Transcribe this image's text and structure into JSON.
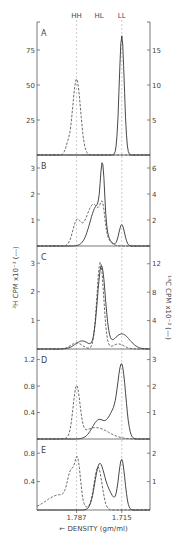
{
  "chart_data": {
    "type": "line",
    "title": "",
    "xlabel": "← DENSITY (gm/ml)",
    "ylabel_left": "³H CPM x10⁻³ (---)",
    "ylabel_right": "¹⁴C CPM x10⁻³ (—)",
    "x_ticks": [
      {
        "label": "1.787",
        "pos": 0.35
      },
      {
        "label": "1.715",
        "pos": 0.75
      }
    ],
    "reference_lines": [
      {
        "label": "HH",
        "pos": 0.35
      },
      {
        "label": "HL",
        "pos": 0.55
      },
      {
        "label": "LL",
        "pos": 0.75
      }
    ],
    "colors": {
      "axis": "#555555",
      "solid": "#333333",
      "dashed": "#444444",
      "ref": "#aaaaaa"
    },
    "panels": [
      {
        "label": "A",
        "left_ticks": [
          {
            "v": 25,
            "label": "25"
          },
          {
            "v": 50,
            "label": "50"
          },
          {
            "v": 75,
            "label": "75"
          }
        ],
        "left_max": 95,
        "right_ticks": [
          {
            "v": 5,
            "label": "5"
          },
          {
            "v": 10,
            "label": "10"
          },
          {
            "v": 15,
            "label": "15"
          }
        ],
        "right_max": 19,
        "dashed_peaks": [
          {
            "x": 0.35,
            "h": 0.58,
            "w": 0.035
          },
          {
            "x": 0.27,
            "h": 0.06,
            "w": 0.02
          }
        ],
        "solid_peaks": [
          {
            "x": 0.75,
            "h": 0.91,
            "w": 0.022
          }
        ]
      },
      {
        "label": "B",
        "left_ticks": [
          {
            "v": 1,
            "label": "1"
          },
          {
            "v": 2,
            "label": "2"
          },
          {
            "v": 3,
            "label": "3"
          }
        ],
        "left_max": 3.5,
        "right_ticks": [
          {
            "v": 2,
            "label": "2"
          },
          {
            "v": 4,
            "label": "4"
          },
          {
            "v": 6,
            "label": "6"
          }
        ],
        "right_max": 7,
        "dashed_peaks": [
          {
            "x": 0.35,
            "h": 0.25,
            "w": 0.035
          },
          {
            "x": 0.5,
            "h": 0.47,
            "w": 0.07
          },
          {
            "x": 0.58,
            "h": 0.25,
            "w": 0.02
          }
        ],
        "solid_peaks": [
          {
            "x": 0.58,
            "h": 0.62,
            "w": 0.018
          },
          {
            "x": 0.53,
            "h": 0.45,
            "w": 0.06
          },
          {
            "x": 0.75,
            "h": 0.24,
            "w": 0.025
          }
        ]
      },
      {
        "label": "C",
        "left_ticks": [
          {
            "v": 1,
            "label": "1"
          },
          {
            "v": 2,
            "label": "2"
          },
          {
            "v": 3,
            "label": "3"
          }
        ],
        "left_max": 3.6,
        "right_ticks": [
          {
            "v": 4,
            "label": "4"
          },
          {
            "v": 8,
            "label": "8"
          },
          {
            "v": 12,
            "label": "12"
          }
        ],
        "right_max": 14.5,
        "dashed_peaks": [
          {
            "x": 0.56,
            "h": 0.86,
            "w": 0.03
          },
          {
            "x": 0.35,
            "h": 0.06,
            "w": 0.05
          },
          {
            "x": 0.72,
            "h": 0.05,
            "w": 0.05
          }
        ],
        "solid_peaks": [
          {
            "x": 0.57,
            "h": 0.82,
            "w": 0.035
          },
          {
            "x": 0.4,
            "h": 0.08,
            "w": 0.06
          },
          {
            "x": 0.75,
            "h": 0.15,
            "w": 0.07
          }
        ]
      },
      {
        "label": "D",
        "left_ticks": [
          {
            "v": 0.4,
            "label": "0.4"
          },
          {
            "v": 0.8,
            "label": "0.8"
          },
          {
            "v": 1.2,
            "label": "1.2"
          }
        ],
        "left_max": 1.36,
        "right_ticks": [
          {
            "v": 1,
            "label": "1"
          },
          {
            "v": 2,
            "label": "2"
          },
          {
            "v": 3,
            "label": "3"
          }
        ],
        "right_max": 3.4,
        "dashed_peaks": [
          {
            "x": 0.35,
            "h": 0.57,
            "w": 0.03
          },
          {
            "x": 0.52,
            "h": 0.13,
            "w": 0.11
          }
        ],
        "solid_peaks": [
          {
            "x": 0.75,
            "h": 0.82,
            "w": 0.035
          },
          {
            "x": 0.55,
            "h": 0.22,
            "w": 0.06
          },
          {
            "x": 0.67,
            "h": 0.25,
            "w": 0.04
          }
        ]
      },
      {
        "label": "E",
        "left_ticks": [
          {
            "v": 0.4,
            "label": "0.4"
          },
          {
            "v": 0.8,
            "label": "0.8"
          }
        ],
        "left_max": 1.0,
        "right_ticks": [
          {
            "v": 1,
            "label": "1"
          },
          {
            "v": 2,
            "label": "2"
          }
        ],
        "right_max": 2.5,
        "dashed_peaks": [
          {
            "x": 0.36,
            "h": 0.62,
            "w": 0.025
          },
          {
            "x": 0.3,
            "h": 0.4,
            "w": 0.03
          },
          {
            "x": 0.54,
            "h": 0.62,
            "w": 0.035
          },
          {
            "x": 0.2,
            "h": 0.22,
            "w": 0.12
          }
        ],
        "solid_peaks": [
          {
            "x": 0.55,
            "h": 0.6,
            "w": 0.04
          },
          {
            "x": 0.75,
            "h": 0.72,
            "w": 0.028
          },
          {
            "x": 0.63,
            "h": 0.25,
            "w": 0.05
          }
        ]
      }
    ],
    "layout": {
      "panel_tops": [
        22,
        155,
        246,
        349,
        439
      ],
      "panel_bottoms": [
        155,
        246,
        349,
        439,
        510
      ],
      "x_left": 37,
      "x_right": 150
    }
  }
}
